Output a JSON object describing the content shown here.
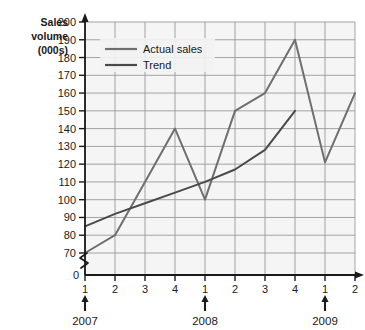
{
  "chart_data": {
    "type": "line",
    "title": "",
    "xlabel": "",
    "ylabel": "Sales volume (000s)",
    "ylabel_lines": [
      "Sales",
      "volume",
      "(000s)"
    ],
    "ylim": [
      70,
      200
    ],
    "y_axis_break": true,
    "y_zero_label": "0",
    "yticks": [
      70,
      80,
      90,
      100,
      110,
      120,
      130,
      140,
      150,
      160,
      170,
      180,
      190,
      200
    ],
    "ytick_labels": [
      "70",
      "80",
      "90",
      "100",
      "110",
      "120",
      "130",
      "140",
      "150",
      "160",
      "170",
      "180",
      "190",
      "200"
    ],
    "grid": true,
    "legend_position": "top-left-inside",
    "x": [
      1,
      2,
      3,
      4,
      5,
      6,
      7,
      8,
      9,
      10
    ],
    "xtick_labels": [
      "1",
      "2",
      "3",
      "4",
      "1",
      "2",
      "3",
      "4",
      "1",
      "2"
    ],
    "x_group_markers": [
      {
        "label": "2007",
        "at_index": 1
      },
      {
        "label": "2008",
        "at_index": 5
      },
      {
        "label": "2009",
        "at_index": 9
      }
    ],
    "series": [
      {
        "name": "Actual sales",
        "color": "#6f6f6f",
        "values": [
          70,
          80,
          110,
          140,
          100,
          150,
          160,
          190,
          121,
          160
        ]
      },
      {
        "name": "Trend",
        "color": "#4a4a4a",
        "values": [
          85,
          92,
          98,
          104,
          110,
          117,
          128,
          150,
          null,
          null
        ]
      }
    ]
  },
  "colors": {
    "plot_background": "#f5f5f5",
    "gridline": "#9a9a9a",
    "axis": "#1a1a1a",
    "actual_sales": "#6f6f6f",
    "trend": "#4a4a4a",
    "text": "#1a1a1a",
    "legend_background": "#f2f2f2"
  },
  "legend": {
    "items": [
      {
        "label": "Actual sales",
        "color": "#6f6f6f"
      },
      {
        "label": "Trend",
        "color": "#4a4a4a"
      }
    ]
  }
}
